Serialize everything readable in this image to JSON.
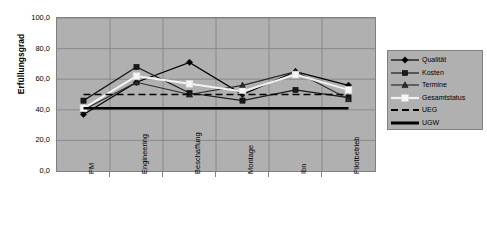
{
  "chart_data": {
    "type": "line",
    "title": "",
    "xlabel": "",
    "ylabel": "Erfüllungsgrad",
    "ylim": [
      0,
      100
    ],
    "ytick_labels": [
      "100,0",
      "80,0",
      "60,0",
      "40,0",
      "20,0",
      "0,0"
    ],
    "ytick_values": [
      100,
      80,
      60,
      40,
      20,
      0
    ],
    "grid": true,
    "legend_position": "right",
    "categories": [
      "PM",
      "Engineering",
      "Beschaffung",
      "Montage",
      "Ibn",
      "Pilotbetrieb"
    ],
    "series": [
      {
        "name": "Qualität",
        "marker": "diamond",
        "color": "#000000",
        "style": "solid",
        "values": [
          37,
          58,
          71,
          50,
          65,
          56
        ]
      },
      {
        "name": "Kosten",
        "marker": "square",
        "color": "#1a1a1a",
        "style": "solid",
        "values": [
          46,
          68,
          51,
          46,
          53,
          48
        ]
      },
      {
        "name": "Termine",
        "marker": "triangle",
        "color": "#2b2b2b",
        "style": "solid",
        "values": [
          40,
          58,
          50,
          56,
          65,
          47
        ]
      },
      {
        "name": "Gesamtstatus",
        "marker": "white-square",
        "color": "#f2f2f2",
        "style": "solid",
        "values": [
          41,
          62,
          57,
          52,
          63,
          53
        ]
      },
      {
        "name": "UEG",
        "marker": "none",
        "color": "#000000",
        "style": "dashed",
        "values": [
          50,
          50,
          50,
          50,
          50,
          50
        ]
      },
      {
        "name": "UGW",
        "marker": "none",
        "color": "#000000",
        "style": "thick-solid",
        "values": [
          41,
          41,
          41,
          41,
          41,
          41
        ]
      }
    ]
  },
  "chart": {
    "plot_background": "#b0b0b0",
    "page_background": "#ffffff",
    "gridline_color": "#808080",
    "border_color": "#808080"
  }
}
